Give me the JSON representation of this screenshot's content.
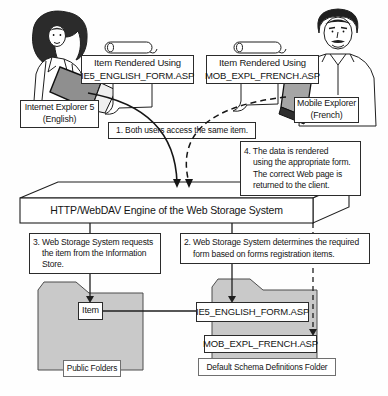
{
  "figure": {
    "left_user": {
      "rendered_using": [
        "Item Rendered Using",
        "IE5_ENGLISH_FORM.ASP"
      ],
      "client": [
        "Internet Explorer 5",
        "(English)"
      ]
    },
    "right_user": {
      "rendered_using": [
        "Item Rendered Using",
        "MOB_EXPL_FRENCH.ASP"
      ],
      "client": [
        "Mobile Explorer",
        "(French)"
      ]
    },
    "steps": {
      "one": [
        "1. Both users access the same item."
      ],
      "two": [
        "2. Web Storage System determines the required",
        "form based on forms registration items."
      ],
      "three": [
        "3. Web Storage System requests",
        "the item from the Information",
        "Store."
      ],
      "four": [
        "4. The data is rendered",
        "using the appropriate form.",
        "The correct Web page is",
        "returned to the client."
      ]
    },
    "engine": {
      "label": "HTTP/WebDAV Engine of the Web Storage System"
    },
    "public_folder": {
      "item": "Item",
      "caption": "Public Folders"
    },
    "schema_folder": {
      "forms": [
        "IE5_ENGLISH_FORM.ASP",
        "MOB_EXPL_FRENCH.ASP"
      ],
      "caption": "Default Schema Definitions Folder"
    },
    "colors": {
      "folder_fill": "#c9c9c9",
      "laptop_fill": "#8f8f8f",
      "device_fill": "#a5a5a5",
      "line_color": "#1f1f1f",
      "box_bg": "#ffffff"
    }
  }
}
